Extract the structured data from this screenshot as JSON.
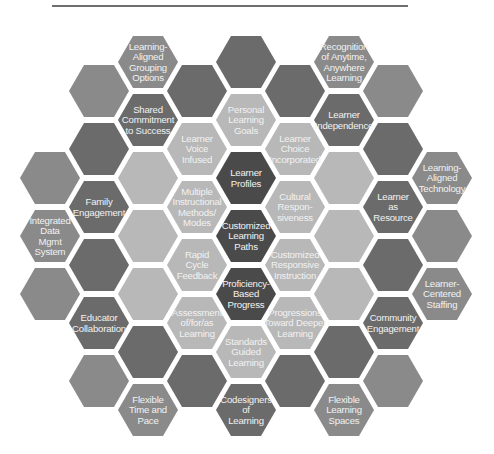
{
  "diagram": {
    "type": "hexagon-grid",
    "shades": {
      "darkest": "#4a4a4a",
      "dark": "#6b6b6b",
      "medium": "#8a8a8a",
      "light": "#a6a6a6",
      "pale": "#b8b8b8"
    },
    "cells": [
      {
        "col": 0,
        "row": 3,
        "shade": "medium",
        "label": []
      },
      {
        "col": 0,
        "row": 4,
        "shade": "medium",
        "label": [
          "Integrated",
          "Data",
          "Mgmt",
          "System"
        ]
      },
      {
        "col": 0,
        "row": 5,
        "shade": "medium",
        "label": []
      },
      {
        "col": 1,
        "row": 1,
        "shade": "medium",
        "label": []
      },
      {
        "col": 1,
        "row": 2,
        "shade": "dark",
        "label": []
      },
      {
        "col": 1,
        "row": 3,
        "shade": "dark",
        "label": [
          "Family",
          "Engagement"
        ]
      },
      {
        "col": 1,
        "row": 4,
        "shade": "dark",
        "label": []
      },
      {
        "col": 1,
        "row": 5,
        "shade": "dark",
        "label": [
          "Educator",
          "Collaboration"
        ]
      },
      {
        "col": 1,
        "row": 6,
        "shade": "medium",
        "label": []
      },
      {
        "col": 2,
        "row": 1,
        "shade": "medium",
        "label": [
          "Learning-",
          "Aligned",
          "Grouping",
          "Options"
        ]
      },
      {
        "col": 2,
        "row": 2,
        "shade": "dark",
        "label": [
          "Shared",
          "Commitment",
          "to Success"
        ]
      },
      {
        "col": 2,
        "row": 3,
        "shade": "pale",
        "label": []
      },
      {
        "col": 2,
        "row": 4,
        "shade": "pale",
        "label": []
      },
      {
        "col": 2,
        "row": 5,
        "shade": "pale",
        "label": []
      },
      {
        "col": 2,
        "row": 6,
        "shade": "dark",
        "label": []
      },
      {
        "col": 2,
        "row": 7,
        "shade": "medium",
        "label": [
          "Flexible",
          "Time and",
          "Pace"
        ]
      },
      {
        "col": 3,
        "row": 1,
        "shade": "dark",
        "label": []
      },
      {
        "col": 3,
        "row": 2,
        "shade": "pale",
        "label": [
          "Learner",
          "Voice",
          "Infused"
        ]
      },
      {
        "col": 3,
        "row": 3,
        "shade": "pale",
        "label": [
          "Multiple",
          "Instructional",
          "Methods/",
          "Modes"
        ]
      },
      {
        "col": 3,
        "row": 4,
        "shade": "pale",
        "label": [
          "Rapid",
          "Cycle",
          "Feedback"
        ]
      },
      {
        "col": 3,
        "row": 5,
        "shade": "pale",
        "label": [
          "Assessment",
          "of/for/as",
          "Learning"
        ]
      },
      {
        "col": 3,
        "row": 6,
        "shade": "dark",
        "label": []
      },
      {
        "col": 4,
        "row": 1,
        "shade": "dark",
        "label": []
      },
      {
        "col": 4,
        "row": 2,
        "shade": "pale",
        "label": [
          "Personal",
          "Learning",
          "Goals"
        ]
      },
      {
        "col": 4,
        "row": 3,
        "shade": "darkest",
        "label": [
          "Learner",
          "Profiles"
        ]
      },
      {
        "col": 4,
        "row": 4,
        "shade": "darkest",
        "label": [
          "Customized",
          "Learning",
          "Paths"
        ]
      },
      {
        "col": 4,
        "row": 5,
        "shade": "darkest",
        "label": [
          "Proficiency-",
          "Based",
          "Progress"
        ]
      },
      {
        "col": 4,
        "row": 6,
        "shade": "pale",
        "label": [
          "Standards",
          "Guided",
          "Learning"
        ]
      },
      {
        "col": 4,
        "row": 7,
        "shade": "dark",
        "label": [
          "Codesigners",
          "of",
          "Learning"
        ]
      },
      {
        "col": 5,
        "row": 1,
        "shade": "dark",
        "label": []
      },
      {
        "col": 5,
        "row": 2,
        "shade": "pale",
        "label": [
          "Learner",
          "Choice",
          "Incorporated"
        ]
      },
      {
        "col": 5,
        "row": 3,
        "shade": "pale",
        "label": [
          "Cultural",
          "Respon-",
          "siveness"
        ]
      },
      {
        "col": 5,
        "row": 4,
        "shade": "pale",
        "label": [
          "Customized",
          "Responsive",
          "Instruction"
        ]
      },
      {
        "col": 5,
        "row": 5,
        "shade": "pale",
        "label": [
          "Progressions",
          "Toward Deeper",
          "Learning"
        ]
      },
      {
        "col": 5,
        "row": 6,
        "shade": "dark",
        "label": []
      },
      {
        "col": 6,
        "row": 1,
        "shade": "medium",
        "label": [
          "Recognition",
          "of Anytime,",
          "Anywhere",
          "Learning"
        ]
      },
      {
        "col": 6,
        "row": 2,
        "shade": "dark",
        "label": [
          "Learner",
          "Independence"
        ]
      },
      {
        "col": 6,
        "row": 3,
        "shade": "pale",
        "label": []
      },
      {
        "col": 6,
        "row": 4,
        "shade": "pale",
        "label": []
      },
      {
        "col": 6,
        "row": 5,
        "shade": "pale",
        "label": []
      },
      {
        "col": 6,
        "row": 6,
        "shade": "dark",
        "label": []
      },
      {
        "col": 6,
        "row": 7,
        "shade": "medium",
        "label": [
          "Flexible",
          "Learning",
          "Spaces"
        ]
      },
      {
        "col": 7,
        "row": 1,
        "shade": "medium",
        "label": []
      },
      {
        "col": 7,
        "row": 2,
        "shade": "dark",
        "label": []
      },
      {
        "col": 7,
        "row": 3,
        "shade": "dark",
        "label": [
          "Learner",
          "as",
          "Resource"
        ]
      },
      {
        "col": 7,
        "row": 4,
        "shade": "dark",
        "label": []
      },
      {
        "col": 7,
        "row": 5,
        "shade": "dark",
        "label": [
          "Community",
          "Engagement"
        ]
      },
      {
        "col": 7,
        "row": 6,
        "shade": "medium",
        "label": []
      },
      {
        "col": 8,
        "row": 3,
        "shade": "medium",
        "label": [
          "Learning-",
          "Aligned",
          "Technology"
        ]
      },
      {
        "col": 8,
        "row": 4,
        "shade": "medium",
        "label": []
      },
      {
        "col": 8,
        "row": 5,
        "shade": "medium",
        "label": [
          "Learner-",
          "Centered",
          "Staffing"
        ]
      }
    ]
  }
}
